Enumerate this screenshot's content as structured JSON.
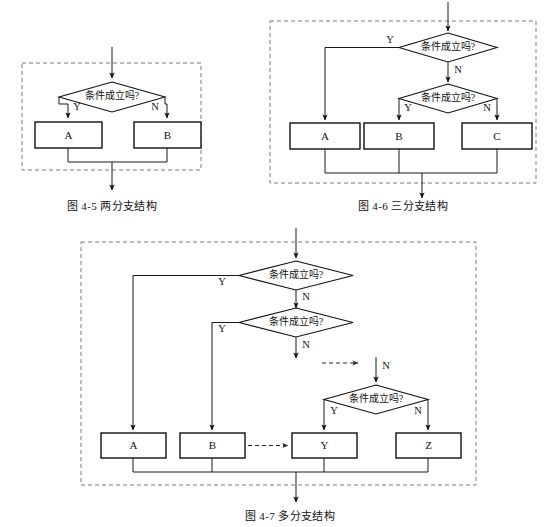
{
  "page": {
    "background": "#ffffff",
    "ink": "#111111",
    "dash_color": "#7a7a7a",
    "width": 545,
    "height": 527
  },
  "labels": {
    "condition": "条件成立吗?",
    "yes": "Y",
    "no": "N"
  },
  "figures": [
    {
      "id": "fig-4-5",
      "caption": "图 4-5    两分支结构",
      "caption_number": "图 4-5",
      "caption_title": "两分支结构",
      "conditions": [
        {
          "name": "condition-1",
          "text": "条件成立吗?",
          "yes": "Y",
          "no": "N"
        }
      ],
      "boxes": [
        {
          "name": "process-a",
          "label": "A"
        },
        {
          "name": "process-b",
          "label": "B"
        }
      ]
    },
    {
      "id": "fig-4-6",
      "caption": "图 4-6    三分支结构",
      "caption_number": "图 4-6",
      "caption_title": "三分支结构",
      "conditions": [
        {
          "name": "condition-1",
          "text": "条件成立吗?",
          "yes": "Y",
          "no": "N"
        },
        {
          "name": "condition-2",
          "text": "条件成立吗?",
          "yes": "Y",
          "no": "N"
        }
      ],
      "boxes": [
        {
          "name": "process-a",
          "label": "A"
        },
        {
          "name": "process-b",
          "label": "B"
        },
        {
          "name": "process-c",
          "label": "C"
        }
      ]
    },
    {
      "id": "fig-4-7",
      "caption": "图 4-7    多分支结构",
      "caption_number": "图 4-7",
      "caption_title": "多分支结构",
      "conditions": [
        {
          "name": "condition-1",
          "text": "条件成立吗?",
          "yes": "Y",
          "no": "N"
        },
        {
          "name": "condition-2",
          "text": "条件成立吗?",
          "yes": "Y",
          "no": "N"
        },
        {
          "name": "condition-3",
          "text": "条件成立吗?",
          "yes": "Y",
          "no": "N"
        }
      ],
      "boxes": [
        {
          "name": "process-a",
          "label": "A"
        },
        {
          "name": "process-b",
          "label": "B"
        },
        {
          "name": "process-y",
          "label": "Y"
        },
        {
          "name": "process-z",
          "label": "Z"
        }
      ],
      "ellipsis_arrow": {
        "name": "continuation-dashed-arrow",
        "style": "dashed"
      }
    }
  ],
  "f1": {
    "cond1": "条件成立吗?",
    "cond1_y": "Y",
    "cond1_n": "N",
    "box_a": "A",
    "box_b": "B",
    "caption": "图 4-5    两分支结构"
  },
  "f2": {
    "cond1": "条件成立吗?",
    "cond1_y": "Y",
    "cond1_n": "N",
    "cond2": "条件成立吗?",
    "cond2_y": "Y",
    "cond2_n": "N",
    "box_a": "A",
    "box_b": "B",
    "box_c": "C",
    "caption": "图 4-6    三分支结构"
  },
  "f3": {
    "cond1": "条件成立吗?",
    "cond1_y": "Y",
    "cond1_n": "N",
    "cond2": "条件成立吗?",
    "cond2_y": "Y",
    "cond2_n": "N",
    "cond3": "条件成立吗?",
    "cond3_y": "Y",
    "cond3_n": "N",
    "box_a": "A",
    "box_b": "B",
    "box_y": "Y",
    "box_z": "Z",
    "caption": "图 4-7    多分支结构"
  }
}
